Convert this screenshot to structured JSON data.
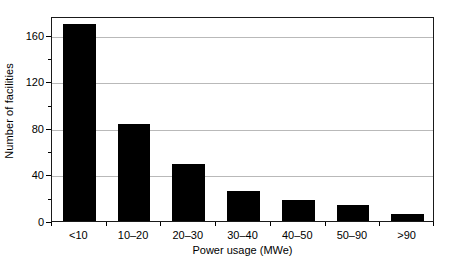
{
  "chart_data": {
    "type": "bar",
    "title": "",
    "subtitle": "",
    "xlabel": "Power usage (MWe)",
    "ylabel": "Number of facilities",
    "categories": [
      "<10",
      "10–20",
      "20–30",
      "30–40",
      "40–50",
      "50–90",
      ">90"
    ],
    "values": [
      169,
      83,
      49,
      26,
      18,
      14,
      6
    ],
    "series": [
      {
        "name": "Number of facilities",
        "values": [
          169,
          83,
          49,
          26,
          18,
          14,
          6
        ]
      }
    ],
    "ylim": [
      0,
      176
    ],
    "xlim_note": "categorical",
    "y_major_ticks": [
      0,
      40,
      80,
      120,
      160
    ],
    "y_minor_ticks": [
      20,
      60,
      100,
      140
    ],
    "y_tick_labels": [
      "0",
      "40",
      "80",
      "120",
      "160"
    ],
    "grid": "horizontal-major-only",
    "legend": "none",
    "legend_position": "",
    "annotations": [],
    "colors": {
      "bar": "#000000",
      "background": "#ffffff",
      "gridline": "#b9b9b9",
      "axis": "#1a1a1a",
      "text": "#000000"
    }
  }
}
